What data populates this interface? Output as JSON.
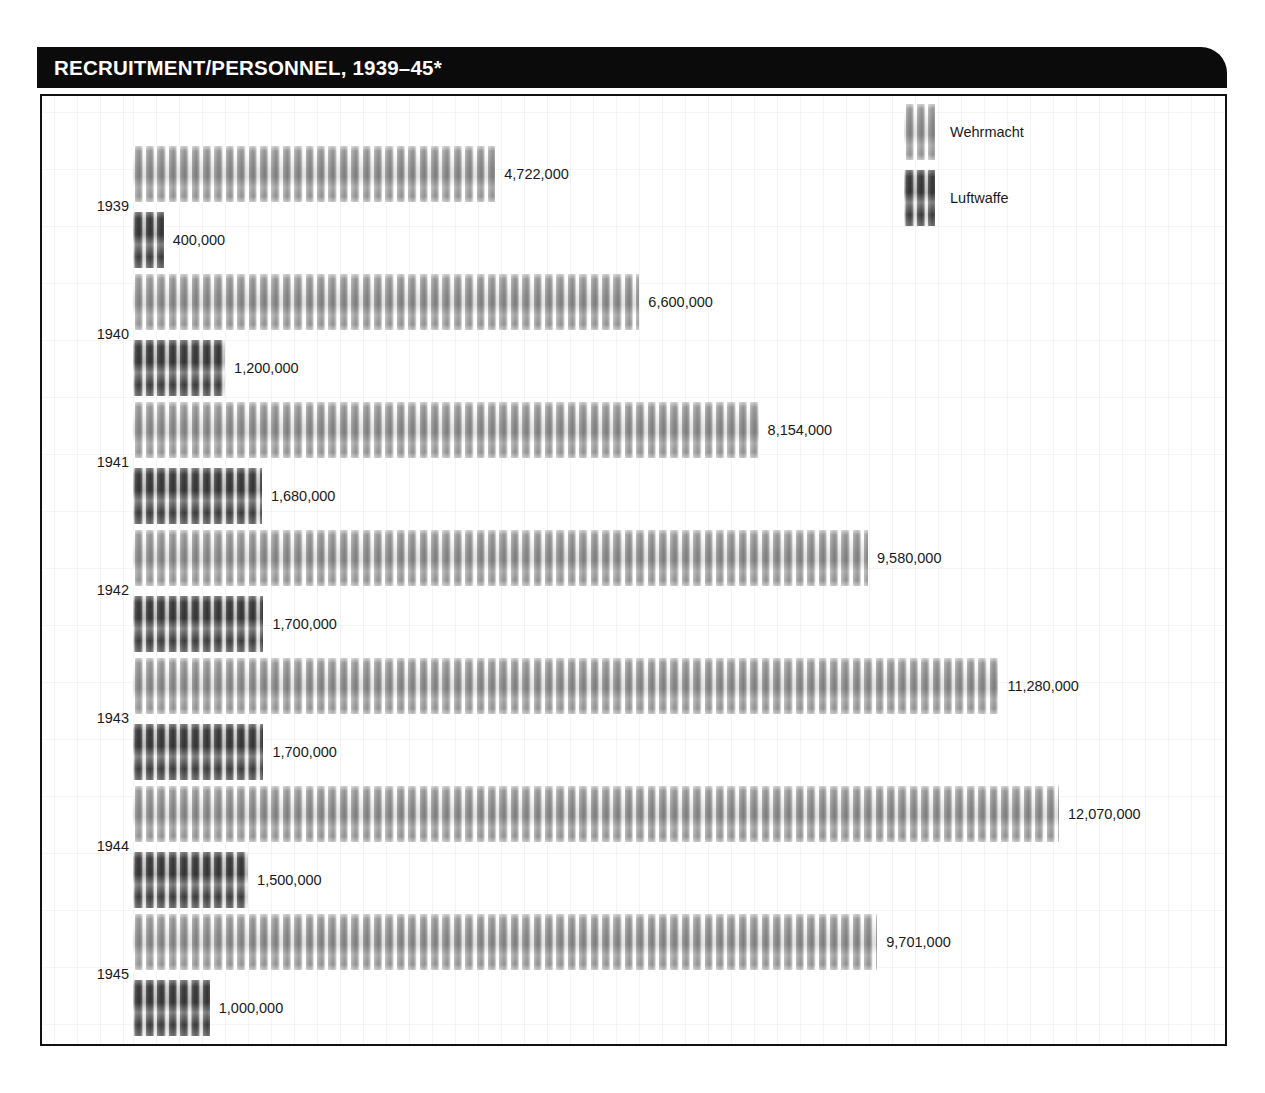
{
  "header": {
    "title": "RECRUITMENT/PERSONNEL, 1939–45*"
  },
  "chart_data": {
    "type": "bar",
    "orientation": "horizontal",
    "title": "RECRUITMENT/PERSONNEL, 1939–45*",
    "xlabel": "",
    "ylabel": "",
    "categories": [
      "1939",
      "1940",
      "1941",
      "1942",
      "1943",
      "1944",
      "1945"
    ],
    "series": [
      {
        "name": "Wehrmacht",
        "color": "#9c9c9c",
        "values": [
          4722000,
          6600000,
          8154000,
          9580000,
          11280000,
          12070000,
          9701000
        ],
        "labels": [
          "4,722,000",
          "6,600,000",
          "8,154,000",
          "9,580,000",
          "11,280,000",
          "12,070,000",
          "9,701,000"
        ]
      },
      {
        "name": "Luftwaffe",
        "color": "#4b4b4b",
        "values": [
          400000,
          1200000,
          1680000,
          1700000,
          1700000,
          1500000,
          1000000
        ],
        "labels": [
          "400,000",
          "1,200,000",
          "1,680,000",
          "1,700,000",
          "1,700,000",
          "1,500,000",
          "1,000,000"
        ]
      }
    ],
    "xlim": [
      0,
      12070000
    ],
    "grid": true,
    "legend_position": "top-right",
    "legend": [
      "Wehrmacht",
      "Luftwaffe"
    ]
  },
  "legend": {
    "items": [
      {
        "label": "Wehrmacht",
        "swatch": "wehrmacht-swatch"
      },
      {
        "label": "Luftwaffe",
        "swatch": "luftwaffe-swatch"
      }
    ]
  },
  "rows": [
    {
      "year": "1939",
      "wehrmacht": {
        "value": 4722000,
        "label": "4,722,000"
      },
      "luftwaffe": {
        "value": 400000,
        "label": "400,000"
      }
    },
    {
      "year": "1940",
      "wehrmacht": {
        "value": 6600000,
        "label": "6,600,000"
      },
      "luftwaffe": {
        "value": 1200000,
        "label": "1,200,000"
      }
    },
    {
      "year": "1941",
      "wehrmacht": {
        "value": 8154000,
        "label": "8,154,000"
      },
      "luftwaffe": {
        "value": 1680000,
        "label": "1,680,000"
      }
    },
    {
      "year": "1942",
      "wehrmacht": {
        "value": 9580000,
        "label": "9,580,000"
      },
      "luftwaffe": {
        "value": 1700000,
        "label": "1,700,000"
      }
    },
    {
      "year": "1943",
      "wehrmacht": {
        "value": 11280000,
        "label": "11,280,000"
      },
      "luftwaffe": {
        "value": 1700000,
        "label": "1,700,000"
      }
    },
    {
      "year": "1944",
      "wehrmacht": {
        "value": 12070000,
        "label": "12,070,000"
      },
      "luftwaffe": {
        "value": 1500000,
        "label": "1,500,000"
      }
    },
    {
      "year": "1945",
      "wehrmacht": {
        "value": 9701000,
        "label": "9,701,000"
      },
      "luftwaffe": {
        "value": 1000000,
        "label": "1,000,000"
      }
    }
  ]
}
